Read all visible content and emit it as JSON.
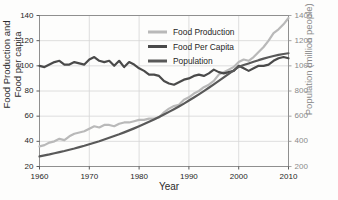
{
  "figure": {
    "clipped_title_fragment": "",
    "background_color": "#fdfdfc"
  },
  "axes": {
    "x": {
      "label": "Year",
      "ticks": [
        1960,
        1970,
        1980,
        1990,
        2000,
        2010
      ],
      "tick_labels": [
        "1960",
        "1970",
        "1980",
        "1990",
        "2000",
        "2010"
      ],
      "range": [
        1960,
        2010
      ]
    },
    "y_left": {
      "label_line1": "Food Production and",
      "label_line2": "Food per capita",
      "ticks": [
        20,
        40,
        60,
        80,
        100,
        120,
        140
      ],
      "tick_labels": [
        "20",
        "40",
        "60",
        "80",
        "100",
        "120",
        "140"
      ],
      "range": [
        20,
        140
      ],
      "color": "#1f1f1f"
    },
    "y_right": {
      "label_line1": "Population",
      "label_line2": "(million people)",
      "ticks": [
        200,
        400,
        600,
        800,
        1000,
        1200,
        1400
      ],
      "tick_labels": [
        "200",
        "400",
        "600",
        "800",
        "1000",
        "1200",
        "1400"
      ],
      "range": [
        200,
        1400
      ],
      "color": "#8a8a8a"
    }
  },
  "legend": {
    "position": "top-center",
    "entries": [
      {
        "label": "Food Production",
        "color": "#b9b9b9"
      },
      {
        "label": "Food Per Capita",
        "color": "#4a4a4a"
      },
      {
        "label": "Population",
        "color": "#595959"
      }
    ]
  },
  "chart_data": {
    "type": "line",
    "title": "",
    "xlabel": "Year",
    "ylabel": "Food Production and Food per capita",
    "ylabel_right": "Population (million people)",
    "xlim": [
      1960,
      2010
    ],
    "ylim": [
      20,
      140
    ],
    "ylim_right": [
      200,
      1400
    ],
    "grid": true,
    "legend_position": "top-center",
    "x": [
      1960,
      1961,
      1962,
      1963,
      1964,
      1965,
      1966,
      1967,
      1968,
      1969,
      1970,
      1971,
      1972,
      1973,
      1974,
      1975,
      1976,
      1977,
      1978,
      1979,
      1980,
      1981,
      1982,
      1983,
      1984,
      1985,
      1986,
      1987,
      1988,
      1989,
      1990,
      1991,
      1992,
      1993,
      1994,
      1995,
      1996,
      1997,
      1998,
      1999,
      2000,
      2001,
      2002,
      2003,
      2004,
      2005,
      2006,
      2007,
      2008,
      2009,
      2010
    ],
    "series": [
      {
        "name": "Food Production",
        "color": "#b9b9b9",
        "axis": "left",
        "values": [
          36,
          37,
          39,
          40,
          42,
          41,
          44,
          46,
          47,
          48,
          50,
          52,
          51,
          53,
          53,
          52,
          54,
          55,
          55,
          56,
          57,
          57,
          58,
          58,
          59,
          63,
          66,
          68,
          69,
          73,
          75,
          78,
          80,
          83,
          85,
          88,
          93,
          95,
          97,
          99,
          103,
          105,
          104,
          107,
          111,
          115,
          120,
          126,
          129,
          133,
          138
        ]
      },
      {
        "name": "Food Per Capita",
        "color": "#4a4a4a",
        "axis": "left",
        "values": [
          100,
          99,
          101,
          103,
          104,
          101,
          101,
          103,
          102,
          101,
          105,
          107,
          104,
          103,
          104,
          100,
          104,
          99,
          103,
          101,
          98,
          96,
          93,
          93,
          92,
          88,
          86,
          85,
          87,
          89,
          90,
          92,
          93,
          92,
          94,
          97,
          95,
          94,
          95,
          96,
          100,
          98,
          96,
          98,
          100,
          100,
          101,
          104,
          106,
          107,
          106
        ]
      },
      {
        "name": "Population",
        "color": "#595959",
        "axis": "right",
        "values": [
          280,
          288,
          296,
          305,
          314,
          323,
          333,
          343,
          354,
          365,
          377,
          389,
          401,
          414,
          428,
          442,
          456,
          471,
          487,
          503,
          520,
          537,
          555,
          574,
          593,
          613,
          634,
          655,
          677,
          700,
          724,
          748,
          773,
          799,
          826,
          853,
          880,
          908,
          936,
          964,
          992,
          1006,
          1019,
          1032,
          1045,
          1057,
          1068,
          1078,
          1087,
          1094,
          1100
        ]
      }
    ]
  }
}
